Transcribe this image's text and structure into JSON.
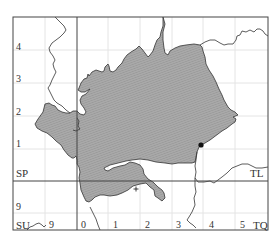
{
  "map": {
    "type": "grid-square distribution map",
    "colors": {
      "frame": "#444444",
      "grid_minor": "#e2e2e2",
      "region_fill": "#a9a9a9",
      "region_stroke": "#333333",
      "boundary": "#333333",
      "marker": "#111111"
    },
    "grid_squares": [
      {
        "code": "SP",
        "x": 16,
        "y": 168
      },
      {
        "code": "TL",
        "x": 250,
        "y": 168
      },
      {
        "code": "SU",
        "x": 16,
        "y": 220
      },
      {
        "code": "TQ",
        "x": 253,
        "y": 220
      }
    ],
    "left_axis_labels": [
      {
        "text": "4",
        "y": 42
      },
      {
        "text": "3",
        "y": 74
      },
      {
        "text": "2",
        "y": 107
      },
      {
        "text": "1",
        "y": 139
      },
      {
        "text": "9",
        "y": 202
      }
    ],
    "bottom_axis_labels": [
      {
        "text": "9",
        "x": 49
      },
      {
        "text": "0",
        "x": 81
      },
      {
        "text": "1",
        "x": 113
      },
      {
        "text": "2",
        "x": 145
      },
      {
        "text": "3",
        "x": 176
      },
      {
        "text": "4",
        "x": 209
      },
      {
        "text": "5",
        "x": 240
      }
    ],
    "markers": [
      {
        "type": "dot",
        "x": 201,
        "y": 145
      },
      {
        "type": "cross",
        "x": 136,
        "y": 189
      }
    ]
  }
}
